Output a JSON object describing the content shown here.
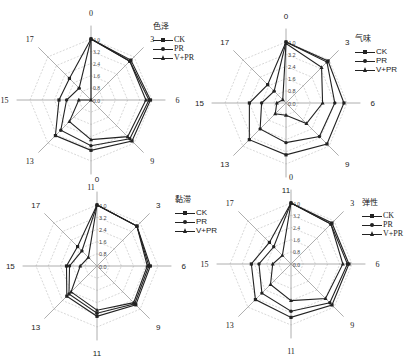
{
  "chart_data": [
    {
      "type": "radar",
      "title": "色泽",
      "categories": [
        "0",
        "3",
        "6",
        "9",
        "11",
        "13",
        "15",
        "17"
      ],
      "radial_ticks": [
        "0.0",
        "0.8",
        "1.6",
        "2.4",
        "3.2",
        "4.0"
      ],
      "rlim": [
        0,
        4.0
      ],
      "grid": true,
      "legend_position": "top-right",
      "series": [
        {
          "name": "CK",
          "marker": "square",
          "values": [
            4.0,
            3.7,
            3.9,
            3.8,
            3.3,
            3.3,
            2.1,
            2.0
          ]
        },
        {
          "name": "PR",
          "marker": "circle",
          "values": [
            4.0,
            3.6,
            3.8,
            3.6,
            3.0,
            2.8,
            1.6,
            1.1
          ]
        },
        {
          "name": "V+PR",
          "marker": "triangle",
          "values": [
            4.0,
            3.6,
            3.6,
            3.4,
            2.6,
            2.0,
            0.8,
            0.0
          ]
        }
      ]
    },
    {
      "type": "radar",
      "title": "气味",
      "categories": [
        "0",
        "3",
        "6",
        "9",
        "11",
        "13",
        "15",
        "17"
      ],
      "radial_ticks": [
        "0.0",
        "0.8",
        "1.6",
        "2.4",
        "3.2",
        "4.0"
      ],
      "rlim": [
        0,
        4.0
      ],
      "grid": true,
      "legend_position": "top-right",
      "series": [
        {
          "name": "CK",
          "marker": "square",
          "values": [
            4.0,
            3.9,
            3.8,
            3.8,
            3.4,
            3.4,
            2.4,
            1.7
          ]
        },
        {
          "name": "PR",
          "marker": "circle",
          "values": [
            4.0,
            3.8,
            3.2,
            3.1,
            2.6,
            2.4,
            1.6,
            1.1
          ]
        },
        {
          "name": "V+PR",
          "marker": "triangle",
          "values": [
            3.9,
            3.3,
            2.4,
            1.9,
            0.8,
            1.0,
            0.6,
            0.3
          ]
        }
      ]
    },
    {
      "type": "radar",
      "title": "黏滞",
      "categories": [
        "0",
        "3",
        "6",
        "9",
        "11",
        "13",
        "15",
        "17"
      ],
      "radial_ticks": [
        "0.0",
        "0.8",
        "1.6",
        "2.4",
        "3.2",
        "4.0"
      ],
      "rlim": [
        0,
        4.0
      ],
      "grid": true,
      "legend_position": "top-right",
      "series": [
        {
          "name": "CK",
          "marker": "square",
          "values": [
            4.0,
            3.7,
            3.5,
            3.6,
            3.3,
            2.8,
            2.0,
            1.8
          ]
        },
        {
          "name": "PR",
          "marker": "circle",
          "values": [
            4.0,
            3.7,
            3.4,
            3.5,
            3.1,
            2.6,
            1.8,
            1.4
          ]
        },
        {
          "name": "V+PR",
          "marker": "triangle",
          "values": [
            4.0,
            3.7,
            3.3,
            3.4,
            2.9,
            2.4,
            1.1,
            0.8
          ]
        }
      ]
    },
    {
      "type": "radar",
      "title": "弹性",
      "categories": [
        "0",
        "3",
        "6",
        "9",
        "11",
        "13",
        "15",
        "17"
      ],
      "radial_ticks": [
        "0.0",
        "0.8",
        "1.6",
        "2.4",
        "3.2",
        "4.0"
      ],
      "rlim": [
        0,
        4.0
      ],
      "grid": true,
      "legend_position": "top-right",
      "series": [
        {
          "name": "CK",
          "marker": "square",
          "values": [
            4.0,
            3.8,
            3.8,
            3.8,
            3.5,
            3.3,
            2.6,
            2.0
          ]
        },
        {
          "name": "PR",
          "marker": "circle",
          "values": [
            4.0,
            3.7,
            3.7,
            3.6,
            3.1,
            2.7,
            2.1,
            1.6
          ]
        },
        {
          "name": "V+PR",
          "marker": "triangle",
          "values": [
            4.0,
            3.7,
            3.4,
            3.2,
            2.4,
            1.9,
            1.2,
            0.8
          ]
        }
      ]
    }
  ],
  "panels": [
    {
      "title": "色泽",
      "legend": [
        "CK",
        "PR",
        "V+PR"
      ]
    },
    {
      "title": "气味",
      "legend": [
        "CK",
        "PR",
        "V+PR"
      ]
    },
    {
      "title": "黏滞",
      "legend": [
        "CK",
        "PR",
        "V+PR"
      ]
    },
    {
      "title": "弹性",
      "legend": [
        "CK",
        "PR",
        "V+PR"
      ]
    }
  ],
  "colors": {
    "line": "#222222",
    "grid": "#bdbdbd",
    "axis": "#9a9a9a"
  }
}
